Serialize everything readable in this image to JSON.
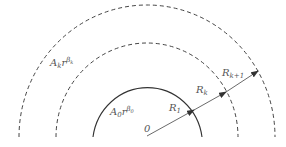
{
  "diagram": {
    "type": "concentric-regions",
    "colors": {
      "line": "#333333",
      "text": "#555555",
      "background": "#ffffff"
    },
    "origin_label": "0",
    "regions": [
      {
        "name": "inner",
        "coefficient": "A",
        "coef_sub": "0",
        "var": "r",
        "exp_base": "β",
        "exp_sub": "0"
      },
      {
        "name": "outer",
        "coefficient": "A",
        "coef_sub": "k",
        "var": "r",
        "exp_base": "β",
        "exp_sub": "k"
      }
    ],
    "radii": [
      {
        "base": "R",
        "sub": "1",
        "style": "solid"
      },
      {
        "base": "R",
        "sub": "k",
        "style": "dashed"
      },
      {
        "base": "R",
        "sub": "k+1",
        "style": "dashed"
      }
    ]
  }
}
